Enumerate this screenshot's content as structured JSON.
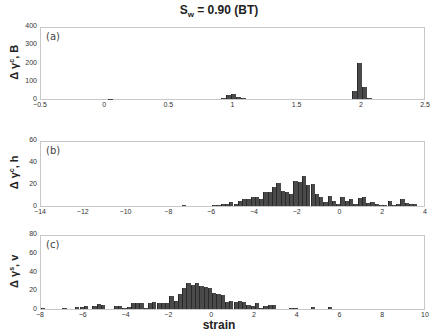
{
  "title": {
    "main": "S",
    "sub": "w",
    "rest": " = 0.90 (BT)"
  },
  "chart_data": [
    {
      "type": "bar",
      "panel": "(a)",
      "ylabel": "Δ γ^c, B",
      "xlabel": "",
      "xlim": [
        -0.5,
        2.5
      ],
      "ylim": [
        0,
        400
      ],
      "xticks": [
        -0.5,
        0,
        0.5,
        1,
        1.5,
        2,
        2.5
      ],
      "yticks": [
        0,
        100,
        200,
        300,
        400
      ],
      "bin_width": 0.04,
      "x": [
        0.04,
        0.92,
        0.96,
        1.0,
        1.04,
        1.08,
        1.94,
        1.98,
        2.02,
        2.06
      ],
      "values": [
        2,
        6,
        20,
        25,
        10,
        4,
        45,
        200,
        65,
        5
      ]
    },
    {
      "type": "bar",
      "panel": "(b)",
      "ylabel": "Δ γ^c, h",
      "xlabel": "",
      "xlim": [
        -14,
        4
      ],
      "ylim": [
        0,
        60
      ],
      "xticks": [
        -14,
        -12,
        -10,
        -8,
        -6,
        -4,
        -2,
        0,
        2,
        4
      ],
      "yticks": [
        0,
        20,
        40,
        60
      ],
      "bin_width": 0.2,
      "x_start": -6.0,
      "isolated": [
        {
          "x": -7.3,
          "value": 1
        }
      ],
      "values": [
        1,
        1,
        2,
        2,
        4,
        2,
        5,
        6,
        6,
        8,
        8,
        6,
        13,
        13,
        17,
        21,
        14,
        13,
        11,
        23,
        22,
        27,
        19,
        20,
        11,
        8,
        4,
        9,
        5,
        2,
        8,
        5,
        6,
        2,
        7,
        8,
        3,
        4,
        2,
        1,
        1,
        5,
        1,
        2,
        6,
        3,
        2,
        2
      ]
    },
    {
      "type": "bar",
      "panel": "(c)",
      "ylabel": "Δ γ^s, v",
      "xlabel": "strain",
      "xlim": [
        -8,
        10
      ],
      "ylim": [
        0,
        80
      ],
      "xticks": [
        -8,
        -6,
        -4,
        -2,
        0,
        2,
        4,
        6,
        8,
        10
      ],
      "yticks": [
        0,
        20,
        40,
        60,
        80
      ],
      "bin_width": 0.2,
      "x_start": -8.0,
      "values": [
        1,
        0,
        0,
        0,
        0,
        1,
        0,
        0,
        2,
        2,
        3,
        0,
        3,
        5,
        4,
        0,
        0,
        3,
        3,
        1,
        2,
        6,
        6,
        6,
        1,
        6,
        7,
        6,
        6,
        6,
        14,
        9,
        16,
        22,
        28,
        26,
        28,
        25,
        23,
        22,
        17,
        16,
        15,
        7,
        9,
        7,
        9,
        8,
        4,
        3,
        6,
        1,
        3,
        4,
        4,
        0,
        0,
        0,
        1,
        1,
        0,
        0,
        0,
        2,
        0,
        0,
        0,
        2,
        0
      ]
    }
  ]
}
